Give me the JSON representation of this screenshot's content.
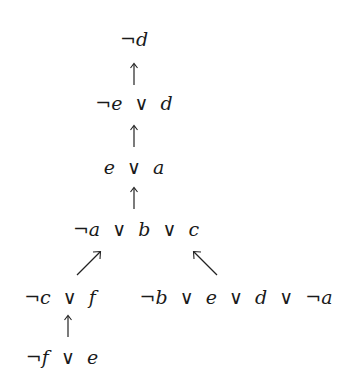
{
  "diagram": {
    "type": "resolution-tree",
    "nodes": [
      {
        "id": "n1",
        "label": "¬d"
      },
      {
        "id": "n2",
        "label": "¬e ∨ d"
      },
      {
        "id": "n3",
        "label": "e ∨ a"
      },
      {
        "id": "n4",
        "label": "¬a ∨ b ∨ c"
      },
      {
        "id": "n5",
        "label": "¬c ∨ f"
      },
      {
        "id": "n6",
        "label": "¬b ∨ e ∨ d ∨ ¬a"
      },
      {
        "id": "n7",
        "label": "¬f ∨ e"
      }
    ],
    "edges": [
      {
        "from": "n2",
        "to": "n1"
      },
      {
        "from": "n3",
        "to": "n2"
      },
      {
        "from": "n4",
        "to": "n3"
      },
      {
        "from": "n5",
        "to": "n4"
      },
      {
        "from": "n6",
        "to": "n4"
      },
      {
        "from": "n7",
        "to": "n5"
      }
    ]
  }
}
